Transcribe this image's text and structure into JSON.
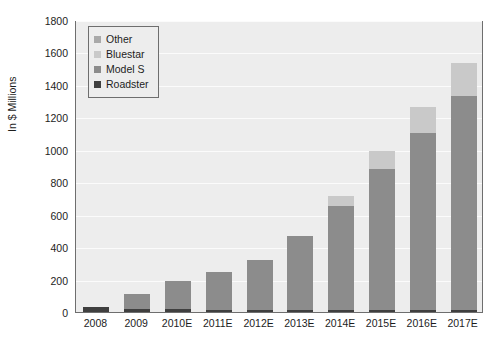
{
  "chart_data": {
    "type": "bar",
    "subtype": "stacked-bar",
    "title": "",
    "xlabel": "",
    "ylabel": "In $ Millions",
    "ylim": [
      0,
      1800
    ],
    "ytick_step": 200,
    "yticks": [
      0,
      200,
      400,
      600,
      800,
      1000,
      1200,
      1400,
      1600,
      1800
    ],
    "categories": [
      "2008",
      "2009",
      "2010E",
      "2011E",
      "2012E",
      "2013E",
      "2014E",
      "2015E",
      "2016E",
      "2017E"
    ],
    "grid": true,
    "legend_position": "top-left",
    "legend_order": [
      "Other",
      "Bluestar",
      "Model S",
      "Roadster"
    ],
    "stack_order_bottom_to_top": [
      "Roadster",
      "Model S",
      "Bluestar",
      "Other"
    ],
    "series": [
      {
        "name": "Roadster",
        "color": "#3f3f3f",
        "values": [
          28,
          20,
          16,
          14,
          14,
          14,
          14,
          14,
          14,
          14
        ]
      },
      {
        "name": "Model S",
        "color": "#8c8c8c",
        "values": [
          0,
          90,
          175,
          230,
          304,
          455,
          640,
          620,
          600,
          580
        ]
      },
      {
        "name": "Bluestar",
        "color": "#8c8c8c",
        "values": [
          0,
          0,
          0,
          0,
          0,
          0,
          0,
          250,
          490,
          735
        ]
      },
      {
        "name": "Other",
        "color": "#c9c9c9",
        "values": [
          0,
          0,
          0,
          0,
          0,
          0,
          60,
          110,
          160,
          205
        ]
      }
    ],
    "totals": [
      28,
      110,
      191,
      244,
      318,
      469,
      714,
      994,
      1264,
      1534
    ]
  },
  "legend": {
    "items": [
      {
        "label": "Other",
        "color": "#a9a9a9"
      },
      {
        "label": "Bluestar",
        "color": "#c9c9c9"
      },
      {
        "label": "Model S",
        "color": "#8c8c8c"
      },
      {
        "label": "Roadster",
        "color": "#3f3f3f"
      }
    ]
  },
  "axes": {
    "y_axis_title": "In $ Millions"
  },
  "style": {
    "plot_background": "#ededed",
    "gridline_color": "#fbfbfb",
    "border_color": "#6e6e6e",
    "text_color": "#1d1d1d",
    "page_background": "#ffffff"
  }
}
